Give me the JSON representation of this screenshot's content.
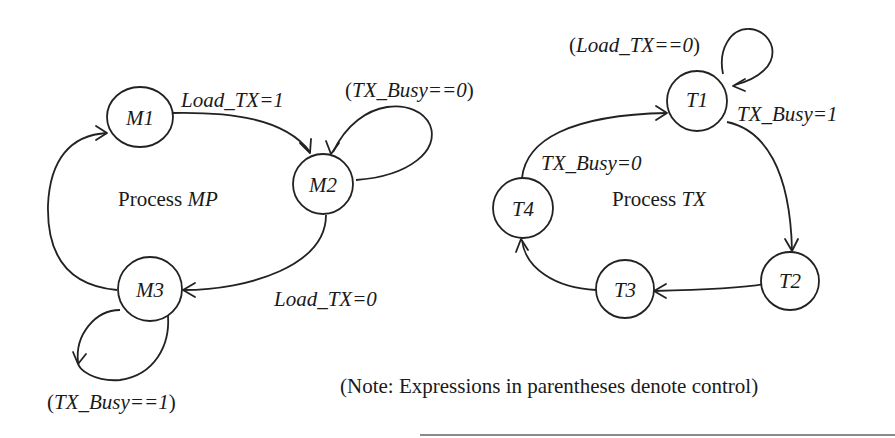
{
  "diagram": {
    "processes": [
      {
        "id": "MP",
        "label_prefix": "Process ",
        "label_name": "MP",
        "states": [
          {
            "id": "M1",
            "label": "M1"
          },
          {
            "id": "M2",
            "label": "M2"
          },
          {
            "id": "M3",
            "label": "M3"
          }
        ],
        "transitions": [
          {
            "from": "M1",
            "to": "M2",
            "label": "Load_TX=1",
            "type": "action"
          },
          {
            "from": "M2",
            "to": "M2",
            "label": "(TX_Busy==0)",
            "type": "control"
          },
          {
            "from": "M2",
            "to": "M3",
            "label": "Load_TX=0",
            "type": "action"
          },
          {
            "from": "M3",
            "to": "M3",
            "label": "(TX_Busy==1)",
            "type": "control"
          },
          {
            "from": "M3",
            "to": "M1",
            "label": "",
            "type": "unconditional"
          }
        ]
      },
      {
        "id": "TX",
        "label_prefix": "Process ",
        "label_name": "TX",
        "states": [
          {
            "id": "T1",
            "label": "T1"
          },
          {
            "id": "T2",
            "label": "T2"
          },
          {
            "id": "T3",
            "label": "T3"
          },
          {
            "id": "T4",
            "label": "T4"
          }
        ],
        "transitions": [
          {
            "from": "T1",
            "to": "T1",
            "label": "(Load_TX==0)",
            "type": "control"
          },
          {
            "from": "T1",
            "to": "T2",
            "label": "TX_Busy=1",
            "type": "action"
          },
          {
            "from": "T2",
            "to": "T3",
            "label": "",
            "type": "unconditional"
          },
          {
            "from": "T3",
            "to": "T4",
            "label": "",
            "type": "unconditional"
          },
          {
            "from": "T4",
            "to": "T1",
            "label": "TX_Busy=0",
            "type": "action"
          }
        ]
      }
    ],
    "note": "(Note: Expressions in parentheses denote control)"
  },
  "labels": {
    "m1": "M1",
    "m2": "M2",
    "m3": "M3",
    "t1": "T1",
    "t2": "T2",
    "t3": "T3",
    "t4": "T4",
    "m1_m2": "Load_TX=1",
    "m2_self": "TX_Busy==0",
    "m2_m3": "Load_TX=0",
    "m3_self": "TX_Busy==1",
    "t1_self": "Load_TX==0",
    "t1_t2": "TX_Busy=1",
    "t4_t1": "TX_Busy=0",
    "process_word": "Process ",
    "mp": "MP",
    "tx": "TX",
    "open_paren": "(",
    "close_paren": ")",
    "note": "(Note: Expressions in parentheses denote control)"
  }
}
